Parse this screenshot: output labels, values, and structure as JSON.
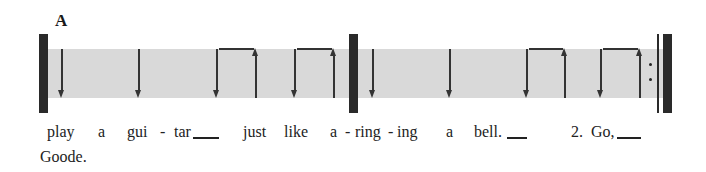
{
  "section": {
    "label": "A"
  },
  "notation": {
    "band_color": "#d9d9d9",
    "ink_color": "#2a2a2a",
    "measures": [
      {
        "strokes": [
          {
            "direction": "down",
            "x": 62
          },
          {
            "direction": "down",
            "x": 139
          },
          {
            "direction": "down",
            "x": 217,
            "beam_to": 256
          },
          {
            "direction": "up",
            "x": 256
          },
          {
            "direction": "down",
            "x": 295,
            "beam_to": 334
          },
          {
            "direction": "up",
            "x": 334
          }
        ]
      },
      {
        "strokes": [
          {
            "direction": "down",
            "x": 373
          },
          {
            "direction": "down",
            "x": 450
          },
          {
            "direction": "down",
            "x": 527,
            "beam_to": 565
          },
          {
            "direction": "up",
            "x": 565
          },
          {
            "direction": "down",
            "x": 601,
            "beam_to": 640
          },
          {
            "direction": "up",
            "x": 640
          }
        ]
      }
    ],
    "end": "repeat-sign"
  },
  "lyrics": {
    "line1": [
      {
        "text": "play",
        "x": 47
      },
      {
        "text": "a",
        "x": 98
      },
      {
        "text": "gui",
        "x": 127
      },
      {
        "text": "-",
        "x": 160
      },
      {
        "text": "tar",
        "x": 174
      },
      {
        "text": "just",
        "x": 243
      },
      {
        "text": "like",
        "x": 284
      },
      {
        "text": "a",
        "x": 330
      },
      {
        "text": "-",
        "x": 345
      },
      {
        "text": "ring",
        "x": 355
      },
      {
        "text": "-",
        "x": 388
      },
      {
        "text": "ing",
        "x": 397
      },
      {
        "text": "a",
        "x": 446
      },
      {
        "text": "bell.",
        "x": 474
      },
      {
        "text": "2.",
        "x": 571
      },
      {
        "text": "Go,",
        "x": 591
      }
    ],
    "line2": [
      {
        "text": "Goode.",
        "x": 40
      }
    ]
  }
}
